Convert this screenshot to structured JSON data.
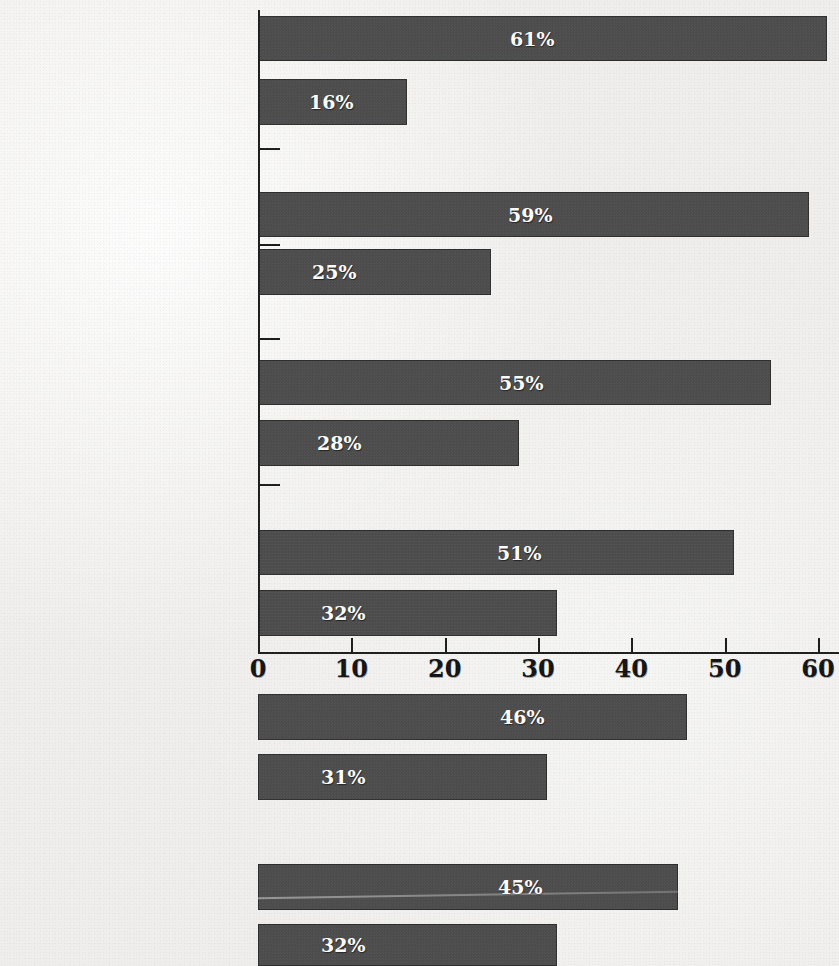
{
  "chart_data": {
    "type": "bar",
    "orientation": "horizontal",
    "title": "",
    "subtitle": "",
    "xlabel": "",
    "ylabel": "",
    "xlim": [
      0,
      60
    ],
    "grid": false,
    "legend": null,
    "axis": {
      "tick_labels": [
        "0",
        "10",
        "20",
        "30",
        "40",
        "50",
        "60"
      ],
      "tick_values": [
        0,
        10,
        20,
        30,
        40,
        50,
        60
      ],
      "position": "middle"
    },
    "value_suffix": "%",
    "bar_color": "#4c4c4c",
    "bar_border_color": "#2e2e2e",
    "value_label_color": "#ffffff",
    "background_color": "#efeeec",
    "categories": [
      "Decreased doctors'\ntime with patients",
      "Increased the\namount of time",
      "Made it harder to see\nmedical specialists",
      "Made it easier",
      "Not made much\ndifference in costs",
      "Helped keep\ncosts down",
      "Decreased the quality\nof care  for the sick",
      "Increased the quality\nof care",
      "Made it easier to get\npreventative services",
      "Made it harder",
      "Decreased the quality\nof patients' care",
      "Increased the quality"
    ],
    "values": [
      61,
      16,
      59,
      25,
      55,
      28,
      51,
      32,
      46,
      31,
      45,
      32
    ],
    "value_labels": [
      "61%",
      "16%",
      "59%",
      "25%",
      "55%",
      "28%",
      "51%",
      "32%",
      "46%",
      "31%",
      "45%",
      "32%"
    ]
  },
  "bars": [
    {
      "label": "Decreased doctors'\ntime with patients",
      "value": 61,
      "value_label": "61%",
      "top": 16,
      "height": 45,
      "label_top": 8,
      "value_x": 510
    },
    {
      "label": "Increased the\namount of time",
      "value": 16,
      "value_label": "16%",
      "top": 79,
      "height": 46,
      "label_top": 72,
      "value_x": 309
    },
    {
      "label": "Made it harder to see\nmedical specialists",
      "value": 59,
      "value_label": "59%",
      "top": 192,
      "height": 45,
      "label_top": 185,
      "value_x": 508
    },
    {
      "label": "Made it easier",
      "value": 25,
      "value_label": "25%",
      "top": 249,
      "height": 46,
      "label_top": 258,
      "value_x": 312
    },
    {
      "label": "Not made much\ndifference in costs",
      "value": 55,
      "value_label": "55%",
      "top": 360,
      "height": 45,
      "label_top": 353,
      "value_x": 499
    },
    {
      "label": "Helped keep\ncosts down",
      "value": 28,
      "value_label": "28%",
      "top": 420,
      "height": 46,
      "label_top": 413,
      "value_x": 317
    },
    {
      "label": "Decreased the quality\nof care  for the sick",
      "value": 51,
      "value_label": "51%",
      "top": 530,
      "height": 45,
      "label_top": 518,
      "value_x": 497
    },
    {
      "label": "Increased the quality\nof care",
      "value": 32,
      "value_label": "32%",
      "top": 590,
      "height": 46,
      "label_top": 579,
      "value_x": 321
    },
    {
      "label": "Made it easier to get\npreventative services",
      "value": 46,
      "value_label": "46%",
      "top": 694,
      "height": 46,
      "label_top": 688,
      "value_x": 500
    },
    {
      "label": "Made it harder",
      "value": 31,
      "value_label": "31%",
      "top": 754,
      "height": 46,
      "label_top": 764,
      "value_x": 321
    },
    {
      "label": "Decreased the quality\nof patients' care",
      "value": 45,
      "value_label": "45%",
      "top": 864,
      "height": 46,
      "label_top": 848,
      "value_x": 498
    },
    {
      "label": "Increased the quality",
      "value": 32,
      "value_label": "32%",
      "top": 924,
      "height": 42,
      "label_top": 930,
      "value_x": 321
    }
  ],
  "category_ticks": [
    {
      "top": 148
    },
    {
      "top": 244
    },
    {
      "top": 338
    },
    {
      "top": 484
    }
  ],
  "axis_ticks": [
    {
      "label": "0",
      "value": 0
    },
    {
      "label": "10",
      "value": 10
    },
    {
      "label": "20",
      "value": 20
    },
    {
      "label": "30",
      "value": 30
    },
    {
      "label": "40",
      "value": 40
    },
    {
      "label": "50",
      "value": 50
    },
    {
      "label": "60",
      "value": 60
    }
  ]
}
